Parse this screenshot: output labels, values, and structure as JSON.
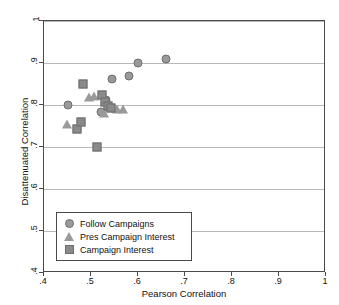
{
  "chart_data": {
    "type": "scatter",
    "title": "",
    "xlabel": "Pearson Correlation",
    "ylabel": "Disattenuated Correlation",
    "xlim": [
      0.4,
      1.0
    ],
    "ylim": [
      0.4,
      1.0
    ],
    "xticks": [
      ".4",
      ".5",
      ".6",
      ".7",
      ".8",
      ".9",
      "1"
    ],
    "xtick_values": [
      0.4,
      0.5,
      0.6,
      0.7,
      0.8,
      0.9,
      1.0
    ],
    "yticks": [
      ".4",
      ".5",
      ".6",
      ".7",
      ".8",
      ".9",
      "1"
    ],
    "ytick_values": [
      0.4,
      0.5,
      0.6,
      0.7,
      0.8,
      0.9,
      1.0
    ],
    "grid": "horizontal",
    "legend_position": "lower-left",
    "series": [
      {
        "name": "Follow Campaigns",
        "marker": "circle",
        "color": "#9a9a9a",
        "points": [
          {
            "x": 0.45,
            "y": 0.8
          },
          {
            "x": 0.521,
            "y": 0.783
          },
          {
            "x": 0.532,
            "y": 0.812
          },
          {
            "x": 0.545,
            "y": 0.862
          },
          {
            "x": 0.58,
            "y": 0.87
          },
          {
            "x": 0.6,
            "y": 0.9
          },
          {
            "x": 0.66,
            "y": 0.91
          }
        ]
      },
      {
        "name": "Pres Campaign Interest",
        "marker": "triangle",
        "color": "#9a9a9a",
        "points": [
          {
            "x": 0.449,
            "y": 0.754
          },
          {
            "x": 0.496,
            "y": 0.818
          },
          {
            "x": 0.507,
            "y": 0.822
          },
          {
            "x": 0.527,
            "y": 0.78
          },
          {
            "x": 0.534,
            "y": 0.796
          },
          {
            "x": 0.556,
            "y": 0.79
          },
          {
            "x": 0.569,
            "y": 0.791
          }
        ]
      },
      {
        "name": "Campaign Interest",
        "marker": "square",
        "color": "#8a8a8a",
        "points": [
          {
            "x": 0.47,
            "y": 0.744
          },
          {
            "x": 0.478,
            "y": 0.76
          },
          {
            "x": 0.482,
            "y": 0.85
          },
          {
            "x": 0.513,
            "y": 0.7
          },
          {
            "x": 0.524,
            "y": 0.824
          },
          {
            "x": 0.53,
            "y": 0.806
          },
          {
            "x": 0.536,
            "y": 0.798
          },
          {
            "x": 0.543,
            "y": 0.794
          }
        ]
      }
    ],
    "legend": [
      {
        "label": "Follow Campaigns",
        "marker": "circle"
      },
      {
        "label": "Pres Campaign Interest",
        "marker": "triangle"
      },
      {
        "label": "Campaign Interest",
        "marker": "square"
      }
    ]
  }
}
